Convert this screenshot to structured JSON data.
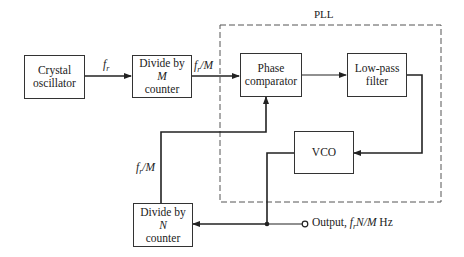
{
  "diagram": {
    "type": "block-diagram",
    "group": {
      "label": "PLL",
      "style": "dashed"
    },
    "blocks": {
      "crystal": {
        "line1": "Crystal",
        "line2": "oscillator"
      },
      "divide_m": {
        "line1": "Divide by",
        "line2": "M",
        "line3": "counter"
      },
      "phase": {
        "line1": "Phase",
        "line2": "comparator"
      },
      "lpf": {
        "line1": "Low-pass",
        "line2": "filter"
      },
      "vco": {
        "line1": "VCO"
      },
      "divide_n": {
        "line1": "Divide by",
        "line2": "N",
        "line3": "counter"
      }
    },
    "signals": {
      "fr": {
        "f": "f",
        "sub": "r",
        "rest": ""
      },
      "fr_over_m": {
        "f": "f",
        "sub": "r",
        "rest": "/M"
      },
      "feedback": {
        "f": "f",
        "sub": "r",
        "rest": "/M"
      },
      "output": {
        "prefix": "Output, ",
        "f": "f",
        "sub": "r",
        "rest": "N/M",
        "suffix": " Hz"
      }
    },
    "connections": [
      {
        "from": "Crystal oscillator",
        "to": "Divide by M counter",
        "label": "f_r"
      },
      {
        "from": "Divide by M counter",
        "to": "Phase comparator",
        "label": "f_r/M"
      },
      {
        "from": "Phase comparator",
        "to": "Low-pass filter"
      },
      {
        "from": "Low-pass filter",
        "to": "VCO"
      },
      {
        "from": "VCO",
        "to": "Output",
        "label": "Output, f_r N/M Hz"
      },
      {
        "from": "Output junction",
        "to": "Divide by N counter"
      },
      {
        "from": "Divide by N counter",
        "to": "Phase comparator",
        "label": "f_r/M"
      }
    ],
    "colors": {
      "line": "#222222",
      "dashed": "#555555",
      "background": "#ffffff"
    }
  }
}
